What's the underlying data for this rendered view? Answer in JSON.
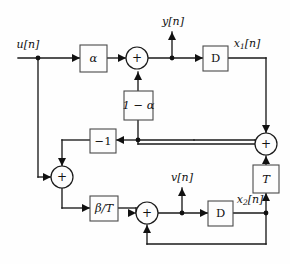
{
  "figure": {
    "type": "signal-flow block diagram",
    "background_color": "#fefefe",
    "line_color": "#1a1a1a",
    "box_fill": "#fdfdfd",
    "box_stroke": "#4a4a4a"
  },
  "signals": {
    "input": "u[n]",
    "output": "y[n]",
    "state1": "x",
    "state1_sub": "1",
    "state1_tail": "[n]",
    "state2": "x",
    "state2_sub": "2",
    "state2_tail": "[n]",
    "intermediate": "v[n]"
  },
  "blocks": [
    {
      "id": "gain-alpha",
      "label": "α",
      "italic": true,
      "x": 80,
      "y": 45,
      "w": 27,
      "h": 27
    },
    {
      "id": "delay-1",
      "label": "D",
      "italic": false,
      "x": 203,
      "y": 46,
      "w": 25,
      "h": 25
    },
    {
      "id": "gain-one-minus-alpha",
      "label": "1 − α",
      "italic": true,
      "x": 124,
      "y": 91,
      "w": 29,
      "h": 29
    },
    {
      "id": "gain-negative-one",
      "label": "−1",
      "italic": false,
      "x": 90,
      "y": 129,
      "w": 26,
      "h": 24
    },
    {
      "id": "gain-beta-over-t",
      "label": "β/T",
      "italic": true,
      "x": 90,
      "y": 196,
      "w": 28,
      "h": 25
    },
    {
      "id": "gain-t",
      "label": "T",
      "italic": true,
      "x": 253,
      "y": 165,
      "w": 26,
      "h": 28
    },
    {
      "id": "delay-2",
      "label": "D",
      "italic": false,
      "x": 208,
      "y": 201,
      "w": 25,
      "h": 25
    }
  ],
  "summing_junctions": [
    {
      "id": "sum-top",
      "sign": "+",
      "cx": 137,
      "cy": 58,
      "r": 11
    },
    {
      "id": "sum-right",
      "sign": "+",
      "cx": 266,
      "cy": 144,
      "r": 11
    },
    {
      "id": "sum-left",
      "sign": "+",
      "cx": 62,
      "cy": 177,
      "r": 11
    },
    {
      "id": "sum-bottom",
      "sign": "+",
      "cx": 147,
      "cy": 213,
      "r": 11
    }
  ],
  "nodes": [
    {
      "id": "tap-input",
      "cx": 38,
      "cy": 58
    },
    {
      "id": "tap-output-y",
      "cx": 172,
      "cy": 58
    },
    {
      "id": "tap-feedback-mid",
      "cx": 138,
      "cy": 140
    },
    {
      "id": "tap-v",
      "cx": 182,
      "cy": 213
    },
    {
      "id": "tap-x2",
      "cx": 266,
      "cy": 213
    }
  ],
  "labels": {
    "u_n": {
      "text": "u[n]",
      "x": 28,
      "y": 45
    },
    "y_n": {
      "text": "y[n]",
      "x": 173,
      "y": 22
    },
    "v_n": {
      "text": "v[n]",
      "x": 182,
      "y": 178
    },
    "x1_n": {
      "x": 247,
      "y": 44
    },
    "x2_n": {
      "x": 250,
      "y": 200
    }
  },
  "equations_depicted": {
    "x1_update": "x1[n+1] = alpha*u[n] + (1-alpha)*( -(x1-path) ) summed at top junction",
    "x2_update": "x2[n+1] = v[n] = beta/T * ( u[n] + feedback ) + x2[n]",
    "output": "y[n] = alpha*u[n] + (1-alpha)*feedback"
  }
}
